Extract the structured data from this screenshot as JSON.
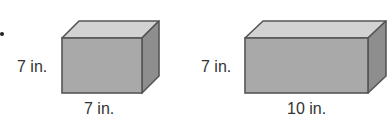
{
  "figure": {
    "boxes": [
      {
        "id": "box-a",
        "height_label": "7 in.",
        "length_label": "7 in.",
        "front": {
          "x": 62,
          "y": 38,
          "w": 80,
          "h": 55
        },
        "depth": {
          "dx": 17,
          "dy": -17
        }
      },
      {
        "id": "box-b",
        "height_label": "7 in.",
        "length_label": "10 in.",
        "front": {
          "x": 245,
          "y": 38,
          "w": 123,
          "h": 55
        },
        "depth": {
          "dx": 18,
          "dy": -17
        }
      }
    ],
    "colors": {
      "front": "#a9a9a9",
      "top": "#d2d2d2",
      "side": "#8e8e8e",
      "edge": "#555555"
    }
  }
}
